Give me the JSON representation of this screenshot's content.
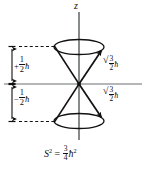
{
  "figure": {
    "background_color": "#ffffff",
    "line_color": "#111111",
    "axis": {
      "z_label": "z",
      "vertical_axis_name": "z-axis",
      "horizontal_axis_name": "transverse-axis"
    },
    "dimension_labels": {
      "upper": {
        "sign": "+",
        "numerator": "1",
        "denominator": "2",
        "symbol": "ħ",
        "full_text": "+1/2 ħ"
      },
      "lower": {
        "sign": "−",
        "numerator": "1",
        "denominator": "2",
        "symbol": "ħ",
        "full_text": "−1/2 ħ"
      }
    },
    "magnitude_labels": {
      "upper": {
        "radical": "√",
        "radicand": "3",
        "denominator": "2",
        "symbol": "ħ",
        "full_text": "√3/2 ħ"
      },
      "lower": {
        "radical": "√",
        "radicand": "3",
        "denominator": "2",
        "symbol": "ħ",
        "full_text": "√3/2 ħ"
      }
    },
    "equation": {
      "lhs_symbol": "S",
      "lhs_exponent": "2",
      "equals": "=",
      "numerator": "3",
      "denominator": "4",
      "rhs_symbol": "ħ",
      "rhs_exponent": "2",
      "full_text": "S² = 3/4 ħ²"
    },
    "geometry": {
      "origin_x": 79,
      "origin_y": 84,
      "cone_rim_rx": 25,
      "cone_rim_ry": 7,
      "upper_rim_y": 47,
      "lower_rim_y": 121,
      "vector_count": 4
    }
  }
}
